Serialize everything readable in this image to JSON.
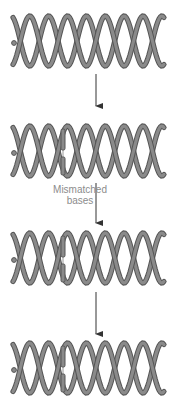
{
  "diagram": {
    "colors": {
      "strand_outline": "#555555",
      "strand_fill": "#8a8a8a",
      "arrow": "#333333",
      "label": "#8c8c8c",
      "background": "#ffffff"
    },
    "helix": {
      "x_start": 13,
      "x_end": 164,
      "turns": 4,
      "amplitude": 25
    },
    "stages": [
      {
        "id": "stage-1",
        "center_y": 41,
        "mismatch": false,
        "bars": "none"
      },
      {
        "id": "stage-2",
        "center_y": 151,
        "mismatch": true,
        "bars": "split"
      },
      {
        "id": "stage-3",
        "center_y": 258,
        "mismatch": true,
        "bars": "split"
      },
      {
        "id": "stage-4",
        "center_y": 368,
        "mismatch": true,
        "bars": "split"
      }
    ],
    "arrows": [
      {
        "x": 96,
        "y1": 74,
        "y2": 106
      },
      {
        "x": 96,
        "y1": 183,
        "y2": 223
      },
      {
        "x": 96,
        "y1": 292,
        "y2": 334
      }
    ],
    "labels": {
      "mismatch_line1": "Mismatched",
      "mismatch_line2": "bases"
    }
  }
}
